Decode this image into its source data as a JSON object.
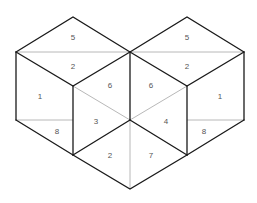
{
  "diagram": {
    "title": "",
    "cubes": [
      {
        "name": "left-cube",
        "faces": {
          "top": [
            "5",
            "2"
          ],
          "left": [
            "1",
            "8"
          ],
          "right": [
            "6",
            "3"
          ]
        }
      },
      {
        "name": "right-cube",
        "faces": {
          "top": [
            "5",
            "2"
          ],
          "left": [
            "6",
            "4"
          ],
          "right": [
            "1",
            "8"
          ]
        }
      }
    ],
    "bottom_rhombus": [
      "2",
      "7"
    ],
    "labels": {
      "left_top_upper": "5",
      "left_top_lower": "2",
      "left_left_upper": "1",
      "left_left_lower": "8",
      "left_right_upper": "6",
      "left_right_lower": "3",
      "right_top_upper": "5",
      "right_top_lower": "2",
      "right_left_upper": "6",
      "right_left_lower": "4",
      "right_right_upper": "1",
      "right_right_lower": "8",
      "bottom_left": "2",
      "bottom_right": "7"
    },
    "colors": {
      "dark_edge": "#1a1a1a",
      "light_edge": "#b8b8b8",
      "label": "#555555",
      "background": "#ffffff"
    }
  }
}
